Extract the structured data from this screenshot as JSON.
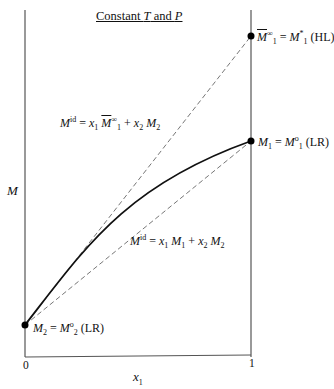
{
  "title": {
    "pre": "Constant ",
    "T": "T",
    "mid": " and ",
    "P": "P"
  },
  "axes": {
    "ylabel": "M",
    "xlabel_base": "x",
    "xlabel_sub": "1",
    "xtick_0": "0",
    "xtick_1": "1"
  },
  "points": {
    "hl": {
      "lhs": "M",
      "lhs_sup": "∞",
      "lhs_sub": "1",
      "eq": " = ",
      "rhs": "M",
      "rhs_sup": "*",
      "rhs_sub": "1",
      "tag": " (HL)"
    },
    "lr1": {
      "lhs": "M",
      "lhs_sub": "1",
      "eq": " = ",
      "rhs": "M",
      "rhs_sup": "o",
      "rhs_sub": "1",
      "tag": " (LR)"
    },
    "lr2": {
      "lhs": "M",
      "lhs_sub": "2",
      "eq": " = ",
      "rhs": "M",
      "rhs_sup": "o",
      "rhs_sub": "2",
      "tag": " (LR)"
    }
  },
  "equations": {
    "upper": {
      "M": "M",
      "sup": "id",
      "eq": " = ",
      "x1": "x",
      "x1s": "1",
      "Mb": "M",
      "Mbsup": "∞",
      "Mbsub": "1",
      "plus": " + ",
      "x2": "x",
      "x2s": "2",
      "M2": "M",
      "M2s": "2"
    },
    "lower": {
      "M": "M",
      "sup": "id",
      "eq": " = ",
      "x1": "x",
      "x1s": "1",
      "M1": "M",
      "M1s": "1",
      "plus": " + ",
      "x2": "x",
      "x2s": "2",
      "M2": "M",
      "M2s": "2"
    }
  },
  "colors": {
    "frame": "#555555",
    "curve": "#111111",
    "dashed": "#666666",
    "point": "#000000"
  }
}
